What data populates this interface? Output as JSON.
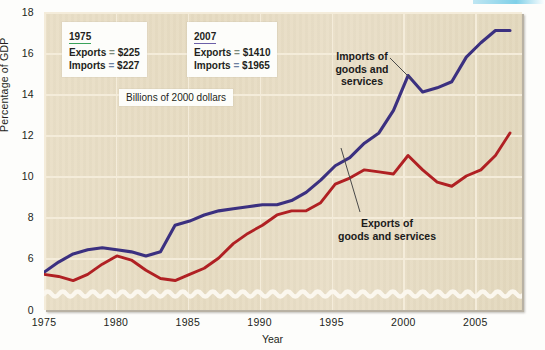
{
  "chart_data": {
    "type": "line",
    "title": "",
    "xlabel": "Year",
    "ylabel": "Percentage of GDP",
    "xlim": [
      1975,
      2007
    ],
    "ylim": [
      5,
      18
    ],
    "y_axis_break": true,
    "y_break_note": "axis broken between 0 and 5; zero baseline drawn with a wavy break line",
    "grid": true,
    "legend_position": "in-plot annotations",
    "yticks": [
      "0",
      "6",
      "8",
      "10",
      "12",
      "14",
      "16",
      "18"
    ],
    "ytick_values": [
      0,
      6,
      8,
      10,
      12,
      14,
      16,
      18
    ],
    "xticks": [
      "1975",
      "1980",
      "1985",
      "1990",
      "1995",
      "2000",
      "2005"
    ],
    "xtick_values": [
      1975,
      1980,
      1985,
      1990,
      1995,
      2000,
      2005
    ],
    "x": [
      1975,
      1976,
      1977,
      1978,
      1979,
      1980,
      1981,
      1982,
      1983,
      1984,
      1985,
      1986,
      1987,
      1988,
      1989,
      1990,
      1991,
      1992,
      1993,
      1994,
      1995,
      1996,
      1997,
      1998,
      1999,
      2000,
      2001,
      2002,
      2003,
      2004,
      2005,
      2006,
      2007
    ],
    "series": [
      {
        "name": "Imports of goods and services",
        "color": "#3b3080",
        "values": [
          5.3,
          5.8,
          6.2,
          6.4,
          6.5,
          6.4,
          6.3,
          6.1,
          6.3,
          7.6,
          7.8,
          8.1,
          8.3,
          8.4,
          8.5,
          8.6,
          8.6,
          8.8,
          9.2,
          9.8,
          10.5,
          10.9,
          11.6,
          12.1,
          13.2,
          14.9,
          14.1,
          14.3,
          14.6,
          15.8,
          16.5,
          17.1,
          17.1
        ]
      },
      {
        "name": "Exports of goods and services",
        "color": "#b02023",
        "values": [
          5.2,
          5.1,
          4.9,
          5.2,
          5.7,
          6.1,
          5.9,
          5.4,
          5.0,
          4.9,
          5.2,
          5.5,
          6.0,
          6.7,
          7.2,
          7.6,
          8.1,
          8.3,
          8.3,
          8.7,
          9.6,
          9.9,
          10.3,
          10.2,
          10.1,
          11.0,
          10.3,
          9.7,
          9.5,
          10.0,
          10.3,
          11.0,
          12.1
        ]
      }
    ],
    "annotations": [
      {
        "name": "year-1975-stats",
        "heading": "1975",
        "rows": [
          {
            "label": "Exports",
            "eq": "=",
            "value": "$225"
          },
          {
            "label": "Imports",
            "eq": "=",
            "value": "$227"
          }
        ]
      },
      {
        "name": "year-2007-stats",
        "heading": "2007",
        "rows": [
          {
            "label": "Exports",
            "eq": "=",
            "value": "$1410"
          },
          {
            "label": "Imports",
            "eq": "=",
            "value": "$1965"
          }
        ]
      }
    ],
    "units_note": "Billions of 2000 dollars",
    "series_label_imports": "Imports of\ngoods and\nservices",
    "series_label_exports": "Exports of\ngoods and services"
  },
  "axes": {
    "ylabel": "Percentage of GDP",
    "xlabel": "Year",
    "yticks": [
      "18",
      "16",
      "14",
      "12",
      "10",
      "8",
      "6",
      "0"
    ],
    "xticks": [
      "1975",
      "1980",
      "1985",
      "1990",
      "1995",
      "2000",
      "2005"
    ]
  },
  "callouts": {
    "left": {
      "heading": "1975",
      "row1_label": "Exports",
      "row1_eq": "=",
      "row1_value": "$225",
      "row2_label": "Imports",
      "row2_eq": "=",
      "row2_value": "$227"
    },
    "right": {
      "heading": "2007",
      "row1_label": "Exports",
      "row1_eq": "=",
      "row1_value": "$1410",
      "row2_label": "Imports",
      "row2_eq": "=",
      "row2_value": "$1965"
    },
    "units": "Billions of 2000 dollars"
  },
  "series_labels": {
    "imports_line1": "Imports of",
    "imports_line2": "goods and",
    "imports_line3": "services",
    "exports_line1": "Exports of",
    "exports_line2": "goods and services"
  },
  "colors": {
    "imports": "#3b3080",
    "exports": "#b02023",
    "plot_background": "#e7dcc3",
    "gridline": "#f4ecda",
    "page_background": "#fdfdfb",
    "heading_underline_left": "#3aa35a",
    "heading_underline_right": "#6b5fa8"
  }
}
